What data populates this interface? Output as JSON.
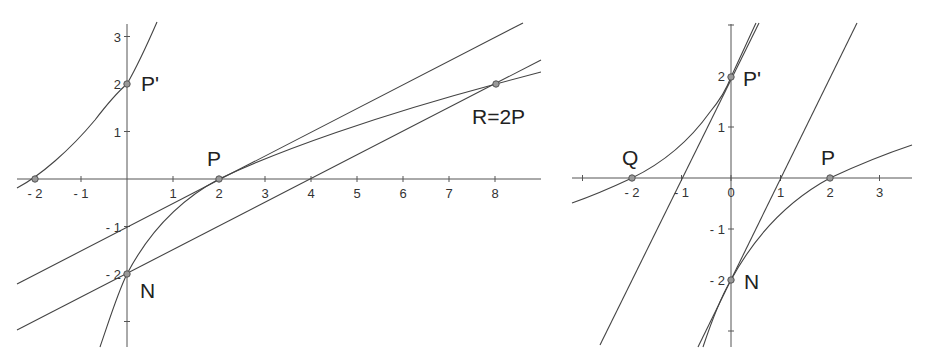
{
  "left_plot": {
    "x_ticks": [
      {
        "label": "- 2",
        "x": -2
      },
      {
        "label": "- 1",
        "x": -1
      },
      {
        "label": "1",
        "x": 1
      },
      {
        "label": "2",
        "x": 2
      },
      {
        "label": "3",
        "x": 3
      },
      {
        "label": "4",
        "x": 4
      },
      {
        "label": "5",
        "x": 5
      },
      {
        "label": "6",
        "x": 6
      },
      {
        "label": "7",
        "x": 7
      },
      {
        "label": "8",
        "x": 8
      }
    ],
    "y_ticks": [
      {
        "label": "3",
        "y": 3
      },
      {
        "label": "2",
        "y": 2
      },
      {
        "label": "1",
        "y": 1
      },
      {
        "label": "- 1",
        "y": -1
      },
      {
        "label": "- 2",
        "y": -2
      },
      {
        "label": "",
        "y": -3
      }
    ],
    "points": {
      "p_prime": {
        "label": "P'",
        "x": 0,
        "y": 2
      },
      "p": {
        "label": "P",
        "x": 2,
        "y": 0
      },
      "n": {
        "label": "N",
        "x": 0,
        "y": -2
      },
      "r": {
        "label": "R=2P",
        "x": 8,
        "y": 2
      },
      "neg2": {
        "label": "",
        "x": -2,
        "y": 0
      }
    },
    "lines": [
      {
        "name": "tangent-at-p",
        "equation": "y = 0.5x - 1"
      },
      {
        "name": "line-through-n",
        "equation": "y = 0.5x - 2"
      }
    ]
  },
  "right_plot": {
    "x_ticks": [
      {
        "label": "",
        "x": -3
      },
      {
        "label": "- 2",
        "x": -2
      },
      {
        "label": "- 1",
        "x": -1
      },
      {
        "label": "0",
        "x": 0
      },
      {
        "label": "1",
        "x": 1
      },
      {
        "label": "2",
        "x": 2
      },
      {
        "label": "3",
        "x": 3
      }
    ],
    "y_ticks": [
      {
        "label": "",
        "y": 3
      },
      {
        "label": "2",
        "y": 2
      },
      {
        "label": "1",
        "y": 1
      },
      {
        "label": "- 1",
        "y": -1
      },
      {
        "label": "- 2",
        "y": -2
      },
      {
        "label": "",
        "y": -3
      }
    ],
    "points": {
      "q": {
        "label": "Q",
        "x": -2,
        "y": 0
      },
      "p_prime": {
        "label": "P'",
        "x": 0,
        "y": 2
      },
      "p": {
        "label": "P",
        "x": 2,
        "y": 0
      },
      "n": {
        "label": "N",
        "x": 0,
        "y": -2
      }
    },
    "lines": [
      {
        "name": "line-through-q-p-prime",
        "equation": "y = 2x + 2"
      },
      {
        "name": "line-through-n",
        "equation": "y = 2x - 2"
      }
    ]
  }
}
